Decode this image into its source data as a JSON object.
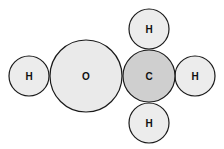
{
  "diagram": {
    "colors": {
      "hydrogen_fill": "#ececec",
      "oxygen_fill": "#eaeaea",
      "carbon_fill": "#cfcfcf",
      "stroke": "#1a1a1a"
    },
    "atoms": [
      {
        "id": "h-left",
        "label": "H",
        "cx": 29,
        "cy": 76,
        "r": 20
      },
      {
        "id": "o",
        "label": "O",
        "cx": 86,
        "cy": 76,
        "r": 36
      },
      {
        "id": "c",
        "label": "C",
        "cx": 149,
        "cy": 76,
        "r": 26
      },
      {
        "id": "h-top",
        "label": "H",
        "cx": 149,
        "cy": 29,
        "r": 20
      },
      {
        "id": "h-right",
        "label": "H",
        "cx": 195,
        "cy": 76,
        "r": 20
      },
      {
        "id": "h-bottom",
        "label": "H",
        "cx": 149,
        "cy": 123,
        "r": 20
      }
    ]
  }
}
